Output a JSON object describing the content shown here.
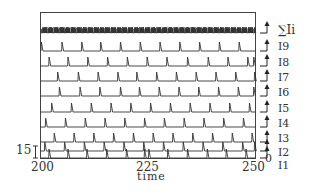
{
  "chart_data": {
    "type": "line",
    "title": "",
    "xlabel": "time",
    "ylabel": "",
    "xlim": [
      200,
      250
    ],
    "x_ticks": [
      200,
      225,
      250
    ],
    "scale_bar": {
      "label": "15",
      "side": "left"
    },
    "zero_label": "0",
    "grid": false,
    "legend_position": "right (row labels)",
    "series": [
      {
        "name": "ΣIi",
        "kind": "summed",
        "spike_times": [],
        "note": "dense spiking, ~10 spikes per unit time"
      },
      {
        "name": "I9",
        "spike_times": [
          200.2,
          205.0,
          209.6,
          214.0,
          218.6,
          223.2,
          227.8,
          232.4,
          237.0,
          241.6,
          246.2
        ]
      },
      {
        "name": "I8",
        "spike_times": [
          202.0,
          206.4,
          211.0,
          215.6,
          220.2,
          224.8,
          229.4,
          234.2,
          239.0,
          243.6,
          248.2,
          249.6
        ]
      },
      {
        "name": "I7",
        "spike_times": [
          204.0,
          208.8,
          213.4,
          218.0,
          222.4,
          227.0,
          231.6,
          236.2,
          240.8,
          245.4,
          249.8
        ]
      },
      {
        "name": "I6",
        "spike_times": [
          204.4,
          209.2,
          213.8,
          218.6,
          223.0,
          227.6,
          232.2,
          236.8,
          241.4,
          246.0,
          249.6
        ]
      },
      {
        "name": "I5",
        "spike_times": [
          202.6,
          207.2,
          211.8,
          216.4,
          221.0,
          225.6,
          230.2,
          234.8,
          239.4,
          244.0,
          248.6
        ]
      },
      {
        "name": "I4",
        "spike_times": [
          201.2,
          205.8,
          210.4,
          215.0,
          219.6,
          224.2,
          228.8,
          233.4,
          238.0,
          242.6,
          247.2
        ]
      },
      {
        "name": "I3",
        "spike_times": [
          203.2,
          207.8,
          212.4,
          217.0,
          221.6,
          226.2,
          230.8,
          235.4,
          240.0,
          244.6,
          249.2
        ]
      },
      {
        "name": "I2",
        "spike_times": [
          201.0,
          205.6,
          210.2,
          214.8,
          219.4,
          224.0,
          228.6,
          233.2,
          237.8,
          242.4,
          247.0,
          249.8
        ]
      },
      {
        "name": "I1",
        "spike_times": [
          202.0,
          206.4,
          210.8,
          215.4,
          220.0,
          224.2,
          225.2,
          229.6,
          234.2,
          238.8,
          243.2,
          247.8
        ]
      }
    ]
  },
  "labels": {
    "x_tick_200": "200",
    "x_tick_225": "225",
    "x_tick_250": "250",
    "xlabel": "time",
    "scale": "15",
    "zero": "0",
    "rows": [
      "∑Ii",
      "I9",
      "I8",
      "I7",
      "I6",
      "I5",
      "I4",
      "I3",
      "I2",
      "I1"
    ]
  }
}
